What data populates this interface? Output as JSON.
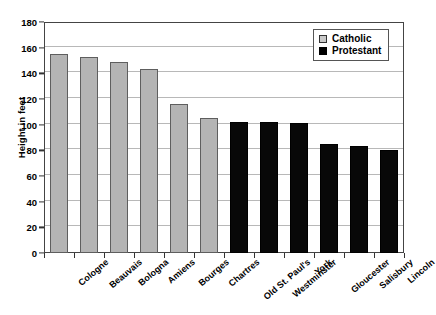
{
  "chart_data": {
    "type": "bar",
    "title": "",
    "xlabel": "",
    "ylabel": "Height in feet",
    "ylim": [
      0,
      180
    ],
    "ytick_step": 20,
    "yticks": [
      0,
      20,
      40,
      60,
      80,
      100,
      120,
      140,
      160,
      180
    ],
    "grid": true,
    "legend_position": "top-right",
    "categories": [
      "Cologne",
      "Beauvais",
      "Bologna",
      "Amiens",
      "Bourges",
      "Chartres",
      "Old St. Paul's",
      "Westminster",
      "York",
      "Gloucester",
      "Salisbury",
      "Lincoln"
    ],
    "values": [
      155,
      153,
      149,
      143,
      116,
      105,
      102,
      102,
      101,
      85,
      83,
      80
    ],
    "groups": [
      "Catholic",
      "Catholic",
      "Catholic",
      "Catholic",
      "Catholic",
      "Catholic",
      "Protestant",
      "Protestant",
      "Protestant",
      "Protestant",
      "Protestant",
      "Protestant"
    ],
    "series": [
      {
        "name": "Catholic",
        "color": "#b4b4b4",
        "points": [
          {
            "category": "Cologne",
            "value": 155
          },
          {
            "category": "Beauvais",
            "value": 153
          },
          {
            "category": "Bologna",
            "value": 149
          },
          {
            "category": "Amiens",
            "value": 143
          },
          {
            "category": "Bourges",
            "value": 116
          },
          {
            "category": "Chartres",
            "value": 105
          }
        ]
      },
      {
        "name": "Protestant",
        "color": "#080808",
        "points": [
          {
            "category": "Old St. Paul's",
            "value": 102
          },
          {
            "category": "Westminster",
            "value": 102
          },
          {
            "category": "York",
            "value": 101
          },
          {
            "category": "Gloucester",
            "value": 85
          },
          {
            "category": "Salisbury",
            "value": 83
          },
          {
            "category": "Lincoln",
            "value": 80
          }
        ]
      }
    ]
  },
  "legend": {
    "items": [
      {
        "label": "Catholic",
        "swatch": "catholic"
      },
      {
        "label": "Protestant",
        "swatch": "protestant"
      }
    ]
  },
  "axes": {
    "y_title": "Height in feet"
  }
}
